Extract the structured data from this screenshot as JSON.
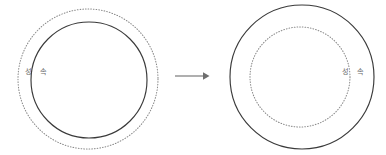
{
  "figure": {
    "background_color": "#ffffff",
    "width": 386,
    "height": 155,
    "line_colors": {
      "solid": "#3a3a3a",
      "dotted": "#8a8a8a",
      "arrow": "#6e6e6e",
      "label": "#6a6a6a"
    }
  },
  "left_group": {
    "name": "left-diagram",
    "outer_circle": {
      "style": "dotted",
      "cx": 88,
      "cy": 79,
      "r": 70
    },
    "inner_circle": {
      "style": "solid",
      "cx": 89,
      "cy": 80,
      "r": 58
    },
    "labels": [
      {
        "text": "성",
        "x": 28,
        "y": 72
      },
      {
        "text": "속",
        "x": 43,
        "y": 72
      }
    ]
  },
  "arrow": {
    "name": "transition-arrow",
    "glyph": "→",
    "x1": 175,
    "y1": 76,
    "x2": 208,
    "y2": 76
  },
  "right_group": {
    "name": "right-diagram",
    "outer_circle": {
      "style": "solid",
      "cx": 302,
      "cy": 77,
      "r": 72
    },
    "inner_circle": {
      "style": "dotted",
      "cx": 300,
      "cy": 77,
      "r": 50
    },
    "labels": [
      {
        "text": "성",
        "x": 345,
        "y": 72
      },
      {
        "text": "속",
        "x": 360,
        "y": 72
      }
    ]
  }
}
